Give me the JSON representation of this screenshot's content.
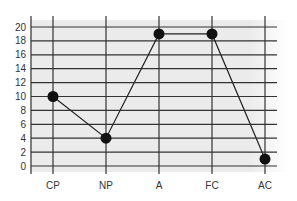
{
  "chart_data": {
    "type": "line",
    "title": "",
    "xlabel": "",
    "ylabel": "",
    "categories": [
      "CP",
      "NP",
      "A",
      "FC",
      "AC"
    ],
    "series": [
      {
        "name": "",
        "values": [
          10,
          4,
          19,
          19,
          1
        ]
      }
    ],
    "ylim": [
      0,
      20
    ],
    "yticks": [
      0,
      2,
      4,
      6,
      8,
      10,
      12,
      14,
      16,
      18,
      20
    ],
    "grid": true,
    "legend": "none",
    "colors": {
      "background": "#ebebeb",
      "grid": "#333333",
      "line": "#222222",
      "marker": "#111111"
    }
  }
}
